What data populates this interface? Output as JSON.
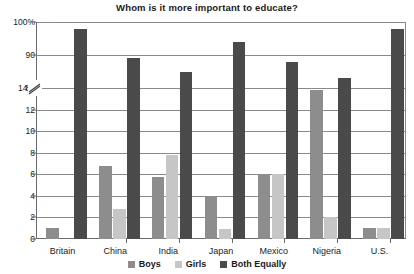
{
  "chart_data": {
    "type": "bar",
    "title": "Whom is it more important to educate?",
    "xlabel": "",
    "ylabel": "",
    "grid": true,
    "legend_position": "bottom",
    "axis_break": true,
    "axis_break_note": "y-axis broken between 14% and 80%",
    "categories": [
      "Britain",
      "China",
      "India",
      "Japan",
      "Mexico",
      "Nigeria",
      "U.S."
    ],
    "ytick_labels": [
      "100%",
      "90",
      "80",
      "14%",
      "12",
      "10",
      "8",
      "6",
      "4",
      "2",
      "0"
    ],
    "ytick_values": [
      100,
      90,
      80,
      14,
      12,
      10,
      8,
      6,
      4,
      2,
      0
    ],
    "lower_range": [
      0,
      14
    ],
    "upper_range": [
      80,
      100
    ],
    "series": [
      {
        "name": "Boys",
        "color": "#8d8d8d",
        "values": [
          1,
          6.8,
          5.8,
          3.9,
          6,
          13.8,
          1
        ]
      },
      {
        "name": "Girls",
        "color": "#c6c6c6",
        "values": [
          0,
          2.8,
          7.8,
          0.9,
          6,
          2,
          1
        ]
      },
      {
        "name": "Both Equally",
        "color": "#4a4a4a",
        "values": [
          98,
          89,
          85,
          94,
          88,
          83,
          98
        ]
      }
    ]
  },
  "legend": {
    "items": [
      {
        "label": "Boys"
      },
      {
        "label": "Girls"
      },
      {
        "label": "Both Equally"
      }
    ]
  }
}
